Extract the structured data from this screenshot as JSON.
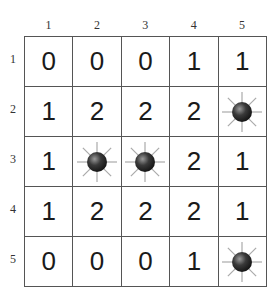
{
  "board": {
    "column_labels": [
      "1",
      "2",
      "3",
      "4",
      "5"
    ],
    "row_labels": [
      "1",
      "2",
      "3",
      "4",
      "5"
    ],
    "cells": [
      [
        "0",
        "0",
        "0",
        "1",
        "1"
      ],
      [
        "1",
        "2",
        "2",
        "2",
        "mine"
      ],
      [
        "1",
        "mine",
        "mine",
        "2",
        "1"
      ],
      [
        "1",
        "2",
        "2",
        "2",
        "1"
      ],
      [
        "0",
        "0",
        "0",
        "1",
        "mine"
      ]
    ],
    "mine_icon": "mine-icon",
    "colors": {
      "grid_line": "#555555",
      "number": "#1a1a1a",
      "mine_body": "#2a2a2a",
      "mine_ray": "#aaaaaa"
    }
  }
}
